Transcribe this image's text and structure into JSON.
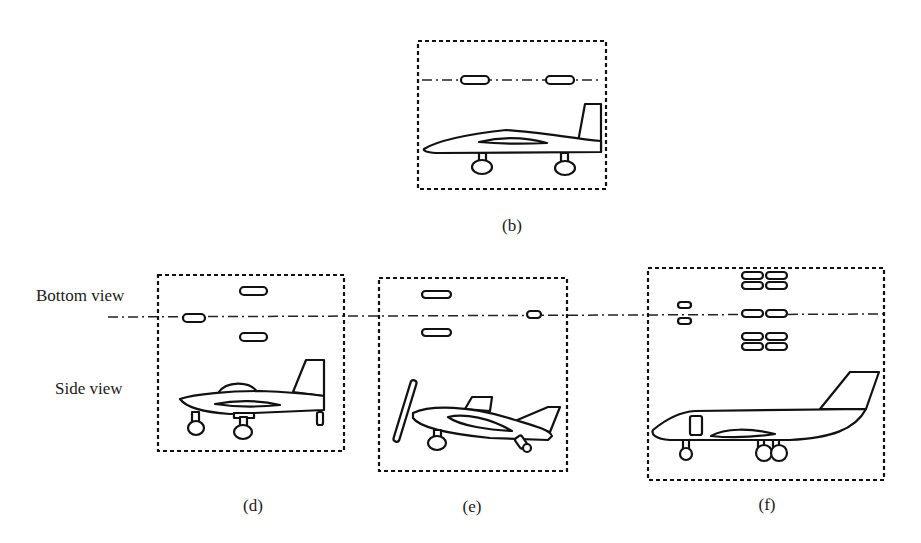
{
  "labels": {
    "bottom_view": "Bottom view",
    "side_view": "Side view"
  },
  "panels": [
    {
      "id": "b",
      "caption": "(b)",
      "aircraft": "tail-dragger-less jet trainer with two-wheel landing gear",
      "bottom_view_wheels": "2 in-line"
    },
    {
      "id": "d",
      "caption": "(d)",
      "aircraft": "canopy aircraft with tricycle gear plus tail skid",
      "bottom_view_wheels": "1 nose + 2 main"
    },
    {
      "id": "e",
      "caption": "(e)",
      "aircraft": "propeller aircraft with tail wheel, nose-up attitude",
      "bottom_view_wheels": "2 main + 1 tail"
    },
    {
      "id": "f",
      "caption": "(f)",
      "aircraft": "business jet with dual nose wheel and multi-wheel bogie main gear",
      "bottom_view_wheels": "2 nose + 10 main (bogies)"
    }
  ],
  "colors": {
    "line": "#111111",
    "background": "#ffffff"
  }
}
